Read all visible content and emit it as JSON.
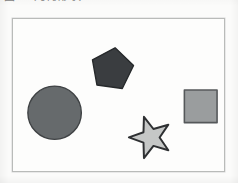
{
  "document": {
    "background_color": "#fbfbfa",
    "caption": {
      "text": "图 2  几何形状",
      "note_visible": "partially cropped at top edge",
      "color": "#5d5d5d"
    }
  },
  "figure": {
    "name": "geometric-shapes-figure",
    "frame": {
      "x": 12,
      "y": 18,
      "width": 213,
      "height": 154,
      "border_color": "#b9bbb9",
      "fill_color": "#fdfdfc",
      "border_width": 1
    },
    "shapes": [
      {
        "id": "circle",
        "label": "Circle",
        "fill": "#666a6c",
        "stroke": "#3f4244",
        "stroke_width": 1.4,
        "cx": 42,
        "cy": 95,
        "r": 27
      },
      {
        "id": "pentagon",
        "label": "Pentagon",
        "fill": "#3a3d40",
        "stroke": "#26292b",
        "stroke_width": 1.4,
        "cx": 100,
        "cy": 51,
        "r": 22,
        "rotation_deg": 8
      },
      {
        "id": "star",
        "label": "Five-pointed Star",
        "fill": "#c5c7c6",
        "stroke": "#2e3032",
        "stroke_width": 2.0,
        "cx": 139,
        "cy": 120,
        "outer_r": 22,
        "inner_r": 9,
        "rotation_deg": -18
      },
      {
        "id": "square",
        "label": "Square",
        "fill": "#9a9d9e",
        "stroke": "#55585a",
        "stroke_width": 1.6,
        "x": 173,
        "y": 72,
        "size": 33
      }
    ],
    "shape_count": 4
  }
}
